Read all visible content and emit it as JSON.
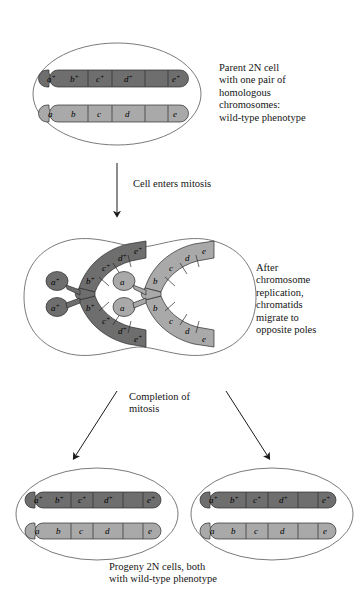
{
  "figure": {
    "background_color": "#ffffff",
    "line_color": "#555555",
    "text_color": "#151515"
  },
  "colors": {
    "chromosome_dark": "#6e6e6e",
    "chromosome_light": "#a9a9a9",
    "chromosome_outline": "#2b2b2b",
    "cell_outline": "#6b6b6b",
    "arrow": "#1a1a1a"
  },
  "captions": {
    "parent": "Parent 2N cell\nwith one pair of\nhomologous\nchromosomes:\nwild-type phenotype",
    "enters_mitosis": "Cell enters mitosis",
    "after_replication": "After\nchromosome\nreplication,\nchromatids\nmigrate to\nopposite poles",
    "completion": "Completion of\nmitosis",
    "progeny": "Progeny 2N cells, both\nwith wild-type phenotype"
  },
  "alleles": {
    "wild_type": [
      "a",
      "b",
      "c",
      "d",
      "e"
    ],
    "wild_type_superscript": "+",
    "mutant_recessive": [
      "a",
      "b",
      "c",
      "d",
      "e"
    ]
  },
  "stages": [
    {
      "id": "parent-cell",
      "name": "Parent 2N cell",
      "shape": "ellipse",
      "chromosomes": [
        {
          "id": "parent-chromosome-dark",
          "shade": "dark",
          "homolog": "paternal",
          "segments": [
            "a+",
            "b+",
            "c+",
            "d+",
            "e+"
          ]
        },
        {
          "id": "parent-chromosome-light",
          "shade": "light",
          "homolog": "maternal",
          "segments": [
            "a",
            "b",
            "c",
            "d",
            "e"
          ]
        }
      ]
    },
    {
      "id": "dividing-cell",
      "name": "Dividing cell (anaphase)",
      "shape": "peanut",
      "chromosomes": [
        {
          "id": "replicated-chromosome-dark",
          "shade": "dark",
          "form": "v-shaped-sister-chromatids",
          "chromatids": [
            {
              "id": "dark-upper",
              "segments": [
                "a+",
                "b+",
                "c+",
                "d+",
                "e+"
              ]
            },
            {
              "id": "dark-lower",
              "segments": [
                "a+",
                "b+",
                "c+",
                "d+",
                "e+"
              ]
            }
          ]
        },
        {
          "id": "replicated-chromosome-light",
          "shade": "light",
          "form": "v-shaped-sister-chromatids",
          "chromatids": [
            {
              "id": "light-upper",
              "segments": [
                "a",
                "b",
                "c",
                "d",
                "e"
              ]
            },
            {
              "id": "light-lower",
              "segments": [
                "a",
                "b",
                "c",
                "d",
                "e"
              ]
            }
          ]
        }
      ]
    },
    {
      "id": "progeny-cell-left",
      "name": "Left progeny 2N cell",
      "shape": "ellipse",
      "chromosomes": [
        {
          "id": "left-progeny-chromosome-dark",
          "shade": "dark",
          "segments": [
            "a+",
            "b+",
            "c+",
            "d+",
            "e+"
          ]
        },
        {
          "id": "left-progeny-chromosome-light",
          "shade": "light",
          "segments": [
            "a",
            "b",
            "c",
            "d",
            "e"
          ]
        }
      ]
    },
    {
      "id": "progeny-cell-right",
      "name": "Right progeny 2N cell",
      "shape": "ellipse",
      "chromosomes": [
        {
          "id": "right-progeny-chromosome-dark",
          "shade": "dark",
          "segments": [
            "a+",
            "b+",
            "c+",
            "d+",
            "e+"
          ]
        },
        {
          "id": "right-progeny-chromosome-light",
          "shade": "light",
          "segments": [
            "a",
            "b",
            "c",
            "d",
            "e"
          ]
        }
      ]
    }
  ],
  "arrows": [
    {
      "id": "arrow-to-mitosis",
      "label": "Cell enters mitosis",
      "direction": "down"
    },
    {
      "id": "arrow-to-left-progeny",
      "label": "Completion of mitosis",
      "direction": "down-left"
    },
    {
      "id": "arrow-to-right-progeny",
      "label": "Completion of mitosis",
      "direction": "down-right"
    }
  ]
}
